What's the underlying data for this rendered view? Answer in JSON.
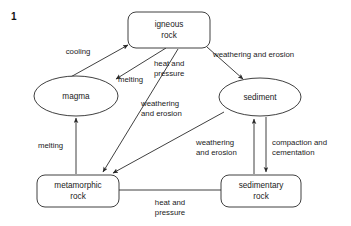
{
  "question_number": "1",
  "diagram": {
    "nodes": [
      {
        "id": "igneous",
        "label_line1": "igneous",
        "label_line2": "rock",
        "shape": "rounded-rect",
        "x": 169,
        "y": 30,
        "w": 82,
        "h": 36
      },
      {
        "id": "magma",
        "label_line1": "magma",
        "label_line2": "",
        "shape": "ellipse",
        "x": 76,
        "y": 96,
        "w": 84,
        "h": 40
      },
      {
        "id": "sediment",
        "label_line1": "sediment",
        "label_line2": "",
        "shape": "ellipse",
        "x": 260,
        "y": 97,
        "w": 82,
        "h": 38
      },
      {
        "id": "metamorphic",
        "label_line1": "metamorphic",
        "label_line2": "rock",
        "shape": "rounded-rect",
        "x": 78,
        "y": 191,
        "w": 82,
        "h": 32
      },
      {
        "id": "sedimentary",
        "label_line1": "sedimentary",
        "label_line2": "rock",
        "shape": "rounded-rect",
        "x": 261,
        "y": 191,
        "w": 80,
        "h": 32
      }
    ],
    "edges": [
      {
        "id": "magma-to-igneous",
        "from": "magma",
        "to": "igneous",
        "label_line1": "cooling",
        "label_line2": "",
        "arrow": "forward"
      },
      {
        "id": "igneous-to-magma",
        "from": "igneous",
        "to": "magma",
        "label_line1": "melting",
        "label_line2": "",
        "arrow": "forward"
      },
      {
        "id": "igneous-to-sediment",
        "from": "igneous",
        "to": "sediment",
        "label_line1": "weathering and erosion",
        "label_line2": "",
        "arrow": "forward"
      },
      {
        "id": "igneous-to-metamorphic",
        "from": "igneous",
        "to": "metamorphic",
        "label_line1": "heat and",
        "label_line2": "pressure",
        "arrow": "forward"
      },
      {
        "id": "sediment-to-metamorphic",
        "from": "sediment",
        "to": "metamorphic",
        "label_line1": "weathering",
        "label_line2": "and erosion",
        "arrow": "forward"
      },
      {
        "id": "metamorphic-to-magma",
        "from": "metamorphic",
        "to": "magma",
        "label_line1": "melting",
        "label_line2": "",
        "arrow": "forward"
      },
      {
        "id": "sedimentary-to-sediment",
        "from": "sedimentary",
        "to": "sediment",
        "label_line1": "weathering",
        "label_line2": "and erosion",
        "arrow": "forward"
      },
      {
        "id": "sediment-to-sedimentary",
        "from": "sediment",
        "to": "sedimentary",
        "label_line1": "compaction and",
        "label_line2": "cementation",
        "arrow": "forward"
      },
      {
        "id": "metamorphic-sedimentary",
        "from": "metamorphic",
        "to": "sedimentary",
        "label_line1": "heat and",
        "label_line2": "pressure",
        "arrow": "none"
      }
    ]
  },
  "colors": {
    "stroke": "#2a2a2a",
    "text": "#1a1a1a",
    "background": "#ffffff"
  }
}
